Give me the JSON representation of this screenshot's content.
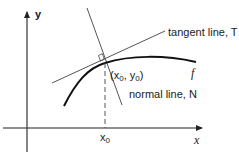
{
  "diagram": {
    "axes": {
      "x_label": "x",
      "y_label": "y"
    },
    "curve": {
      "label": "f"
    },
    "point": {
      "label_open": "(x",
      "label_sub1": "0",
      "label_mid": ", y",
      "label_sub2": "0",
      "label_close": ")"
    },
    "tangent": {
      "label": "tangent line, T"
    },
    "normal": {
      "label": "normal line, N"
    },
    "x0_tick": {
      "label": "x",
      "sub": "0"
    },
    "colors": {
      "curve": "#111111",
      "lines": "#555555",
      "axes": "#222222"
    }
  }
}
